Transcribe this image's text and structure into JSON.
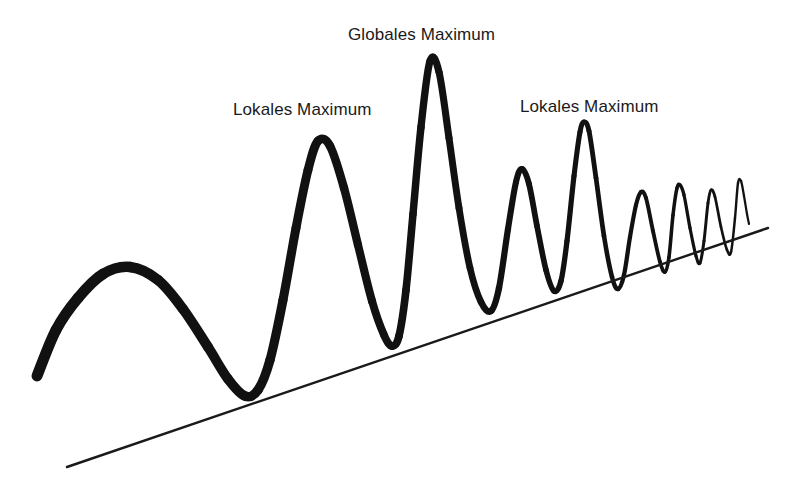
{
  "figure": {
    "title": "",
    "background_color": "#ffffff",
    "width": 794,
    "height": 502
  },
  "annotations": [
    {
      "id": "global-max",
      "text": "Globales Maximum",
      "x": 348,
      "y": 25,
      "points_to_peak_index": 2
    },
    {
      "id": "local-max-1",
      "text": "Lokales Maximum",
      "x": 233,
      "y": 100,
      "points_to_peak_index": 1
    },
    {
      "id": "local-max-2",
      "text": "Lokales Maximum",
      "x": 520,
      "y": 97,
      "points_to_peak_index": 4
    }
  ],
  "colors": {
    "curve": "#111111",
    "baseline": "#1a1a1a",
    "text": "#1a1a1a",
    "background": "#ffffff"
  },
  "chart_data": {
    "type": "line",
    "title": "",
    "subtitle": "",
    "xlabel": "",
    "ylabel": "",
    "xlim": [
      0,
      794
    ],
    "ylim": [
      502,
      0
    ],
    "grid": false,
    "legend": null,
    "series": [
      {
        "name": "oscillating-curve",
        "stroke_start_width": 11,
        "stroke_end_width": 2.2,
        "points": [
          [
            37,
            376
          ],
          [
            56,
            330
          ],
          [
            78,
            298
          ],
          [
            103,
            274
          ],
          [
            130,
            267
          ],
          [
            158,
            280
          ],
          [
            183,
            309
          ],
          [
            208,
            347
          ],
          [
            228,
            379
          ],
          [
            245,
            396
          ],
          [
            258,
            390
          ],
          [
            270,
            360
          ],
          [
            283,
            300
          ],
          [
            296,
            228
          ],
          [
            308,
            170
          ],
          [
            318,
            141
          ],
          [
            330,
            146
          ],
          [
            344,
            188
          ],
          [
            358,
            245
          ],
          [
            372,
            301
          ],
          [
            384,
            335
          ],
          [
            392,
            346
          ],
          [
            399,
            336
          ],
          [
            406,
            290
          ],
          [
            413,
            214
          ],
          [
            421,
            127
          ],
          [
            430,
            61
          ],
          [
            439,
            72
          ],
          [
            449,
            138
          ],
          [
            459,
            208
          ],
          [
            470,
            268
          ],
          [
            481,
            302
          ],
          [
            491,
            311
          ],
          [
            499,
            288
          ],
          [
            508,
            229
          ],
          [
            516,
            182
          ],
          [
            522,
            169
          ],
          [
            529,
            184
          ],
          [
            537,
            226
          ],
          [
            546,
            270
          ],
          [
            554,
            291
          ],
          [
            561,
            281
          ],
          [
            567,
            241
          ],
          [
            574,
            176
          ],
          [
            580,
            132
          ],
          [
            584,
            122
          ],
          [
            589,
            131
          ],
          [
            596,
            178
          ],
          [
            604,
            236
          ],
          [
            612,
            277
          ],
          [
            618,
            289
          ],
          [
            624,
            275
          ],
          [
            630,
            237
          ],
          [
            636,
            205
          ],
          [
            641,
            192
          ],
          [
            646,
            198
          ],
          [
            653,
            231
          ],
          [
            660,
            262
          ],
          [
            665,
            272
          ],
          [
            669,
            257
          ],
          [
            673,
            215
          ],
          [
            677,
            188
          ],
          [
            680,
            185
          ],
          [
            684,
            195
          ],
          [
            690,
            228
          ],
          [
            696,
            256
          ],
          [
            700,
            263
          ],
          [
            704,
            241
          ],
          [
            708,
            203
          ],
          [
            711,
            190
          ],
          [
            715,
            197
          ],
          [
            721,
            227
          ],
          [
            727,
            250
          ],
          [
            731,
            252
          ],
          [
            735,
            218
          ],
          [
            738,
            183
          ],
          [
            741,
            181
          ],
          [
            744,
            196
          ],
          [
            747,
            214
          ],
          [
            749,
            224
          ]
        ],
        "peaks": [
          {
            "index": 0,
            "x": 130,
            "y": 267,
            "kind": "local"
          },
          {
            "index": 1,
            "x": 318,
            "y": 141,
            "kind": "local",
            "label": "Lokales Maximum"
          },
          {
            "index": 2,
            "x": 430,
            "y": 61,
            "kind": "global",
            "label": "Globales Maximum"
          },
          {
            "index": 3,
            "x": 522,
            "y": 169,
            "kind": "local"
          },
          {
            "index": 4,
            "x": 584,
            "y": 122,
            "kind": "local",
            "label": "Lokales Maximum"
          },
          {
            "index": 5,
            "x": 641,
            "y": 192,
            "kind": "local"
          },
          {
            "index": 6,
            "x": 680,
            "y": 185,
            "kind": "local"
          },
          {
            "index": 7,
            "x": 711,
            "y": 190,
            "kind": "local"
          },
          {
            "index": 8,
            "x": 740,
            "y": 181,
            "kind": "local"
          }
        ],
        "troughs": [
          {
            "x": 37,
            "y": 376
          },
          {
            "x": 245,
            "y": 396
          },
          {
            "x": 392,
            "y": 346
          },
          {
            "x": 491,
            "y": 311
          },
          {
            "x": 554,
            "y": 291
          },
          {
            "x": 618,
            "y": 289
          },
          {
            "x": 666,
            "y": 272
          },
          {
            "x": 700,
            "y": 263
          },
          {
            "x": 730,
            "y": 252
          }
        ]
      },
      {
        "name": "trend-baseline",
        "stroke_width": 2.4,
        "points": [
          [
            67,
            467
          ],
          [
            768,
            228
          ]
        ]
      }
    ]
  }
}
